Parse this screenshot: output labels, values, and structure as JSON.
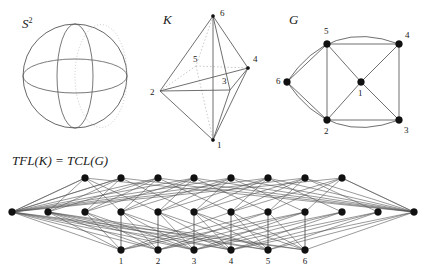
{
  "figure": {
    "background": "#ffffff",
    "stroke": "#555555",
    "node_fill": "#111111",
    "dotted_stroke": "#bbbbbb"
  },
  "panels": {
    "sphere": {
      "label": "S",
      "label_sup": "2",
      "label_x": 22,
      "label_y": 28,
      "name": "sphere-panel",
      "cx": 75,
      "cy": 76,
      "r": 52,
      "meridian_rx": 18,
      "equator_ry": 17
    },
    "octahedron": {
      "label": "K",
      "label_x": 163,
      "label_y": 24,
      "name": "octahedron-panel",
      "vertices": [
        {
          "id": "1",
          "x": 213,
          "y": 140,
          "lx": 217,
          "ly": 148
        },
        {
          "id": "2",
          "x": 160,
          "y": 91,
          "lx": 150,
          "ly": 95
        },
        {
          "id": "3",
          "x": 230,
          "y": 90,
          "lx": 222,
          "ly": 84
        },
        {
          "id": "4",
          "x": 248,
          "y": 68,
          "lx": 253,
          "ly": 62
        },
        {
          "id": "5",
          "x": 196,
          "y": 66,
          "lx": 193,
          "ly": 62
        },
        {
          "id": "6",
          "x": 213,
          "y": 16,
          "lx": 220,
          "ly": 16
        }
      ],
      "solid_edges": [
        [
          "6",
          "2"
        ],
        [
          "6",
          "4"
        ],
        [
          "6",
          "3"
        ],
        [
          "6",
          "1"
        ],
        [
          "2",
          "4"
        ],
        [
          "2",
          "3"
        ],
        [
          "2",
          "1"
        ],
        [
          "3",
          "4"
        ],
        [
          "3",
          "1"
        ],
        [
          "4",
          "1"
        ]
      ],
      "dotted_edges": [
        [
          "6",
          "5"
        ],
        [
          "5",
          "2"
        ],
        [
          "5",
          "4"
        ],
        [
          "5",
          "1"
        ]
      ]
    },
    "graph": {
      "label": "G",
      "label_x": 289,
      "label_y": 24,
      "name": "graph-panel",
      "vertices": [
        {
          "id": "1",
          "x": 361,
          "y": 82,
          "lx": 358,
          "ly": 96
        },
        {
          "id": "2",
          "x": 327,
          "y": 120,
          "lx": 324,
          "ly": 134
        },
        {
          "id": "3",
          "x": 399,
          "y": 120,
          "lx": 404,
          "ly": 133
        },
        {
          "id": "4",
          "x": 399,
          "y": 44,
          "lx": 405,
          "ly": 38
        },
        {
          "id": "5",
          "x": 327,
          "y": 44,
          "lx": 324,
          "ly": 34
        },
        {
          "id": "6",
          "x": 287,
          "y": 82,
          "lx": 276,
          "ly": 84
        }
      ],
      "straight_edges": [
        [
          "5",
          "4"
        ],
        [
          "5",
          "2"
        ],
        [
          "5",
          "1"
        ],
        [
          "5",
          "6"
        ],
        [
          "4",
          "3"
        ],
        [
          "4",
          "1"
        ],
        [
          "2",
          "3"
        ],
        [
          "2",
          "1"
        ],
        [
          "2",
          "6"
        ],
        [
          "3",
          "1"
        ]
      ],
      "curved_edges": [
        {
          "from": "6",
          "to": "4",
          "cx": 330,
          "cy": 18
        },
        {
          "from": "6",
          "to": "3",
          "cx": 330,
          "cy": 146
        }
      ]
    },
    "lattice": {
      "title": "TFL(K) = TCL(G)",
      "title_x": 12,
      "title_y": 165,
      "name": "lattice-panel",
      "rows": {
        "top_y": 178,
        "mid_y": 212,
        "bot_y": 250
      },
      "top_nodes_x": [
        85,
        121,
        158,
        194,
        231,
        268,
        305,
        342
      ],
      "mid_nodes_x": [
        12,
        48,
        85,
        121,
        158,
        194,
        231,
        268,
        305,
        342,
        378,
        414
      ],
      "bottom_nodes": [
        {
          "label": "1",
          "x": 121
        },
        {
          "label": "2",
          "x": 158
        },
        {
          "label": "3",
          "x": 194
        },
        {
          "label": "4",
          "x": 231
        },
        {
          "label": "5",
          "x": 268
        },
        {
          "label": "6",
          "x": 305
        }
      ],
      "bottom_label_y": 264,
      "vertical_edges": [
        [
          121,
          121
        ],
        [
          158,
          158
        ],
        [
          194,
          194
        ],
        [
          231,
          231
        ],
        [
          268,
          268
        ],
        [
          305,
          305
        ]
      ],
      "mid_to_bottom_edges": [
        [
          12,
          121
        ],
        [
          12,
          158
        ],
        [
          12,
          194
        ],
        [
          12,
          231
        ],
        [
          12,
          268
        ],
        [
          12,
          305
        ],
        [
          48,
          121
        ],
        [
          48,
          158
        ],
        [
          48,
          194
        ],
        [
          48,
          231
        ],
        [
          48,
          268
        ],
        [
          48,
          305
        ],
        [
          85,
          121
        ],
        [
          85,
          158
        ],
        [
          85,
          194
        ],
        [
          121,
          158
        ],
        [
          121,
          194
        ],
        [
          121,
          231
        ],
        [
          158,
          194
        ],
        [
          158,
          231
        ],
        [
          158,
          268
        ],
        [
          194,
          231
        ],
        [
          194,
          268
        ],
        [
          194,
          305
        ],
        [
          231,
          268
        ],
        [
          231,
          305
        ],
        [
          231,
          121
        ],
        [
          268,
          305
        ],
        [
          268,
          121
        ],
        [
          268,
          158
        ],
        [
          305,
          121
        ],
        [
          305,
          158
        ],
        [
          305,
          194
        ],
        [
          342,
          158
        ],
        [
          342,
          194
        ],
        [
          342,
          231
        ],
        [
          378,
          194
        ],
        [
          378,
          231
        ],
        [
          378,
          268
        ],
        [
          414,
          231
        ],
        [
          414,
          268
        ],
        [
          414,
          305
        ]
      ],
      "top_to_mid_edges": [
        [
          85,
          12
        ],
        [
          85,
          48
        ],
        [
          85,
          121
        ],
        [
          85,
          158
        ],
        [
          121,
          12
        ],
        [
          121,
          48
        ],
        [
          121,
          85
        ],
        [
          121,
          194
        ],
        [
          158,
          48
        ],
        [
          158,
          85
        ],
        [
          158,
          121
        ],
        [
          158,
          231
        ],
        [
          194,
          85
        ],
        [
          194,
          121
        ],
        [
          194,
          158
        ],
        [
          194,
          268
        ],
        [
          231,
          121
        ],
        [
          231,
          158
        ],
        [
          231,
          194
        ],
        [
          231,
          305
        ],
        [
          268,
          158
        ],
        [
          268,
          194
        ],
        [
          268,
          231
        ],
        [
          268,
          342
        ],
        [
          305,
          194
        ],
        [
          305,
          231
        ],
        [
          305,
          268
        ],
        [
          305,
          378
        ],
        [
          342,
          231
        ],
        [
          342,
          268
        ],
        [
          342,
          305
        ],
        [
          342,
          414
        ]
      ]
    }
  }
}
